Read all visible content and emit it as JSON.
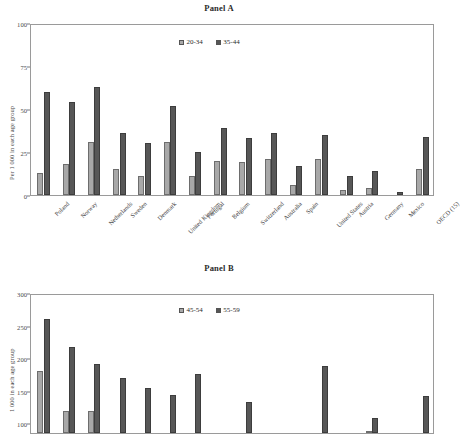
{
  "figure": {
    "ylabel_a": "Per 1 000 in each age group",
    "ylabel_b": "1 000 in each age group"
  },
  "panel_a": {
    "title": "Panel A",
    "legend": [
      {
        "label": "20-34",
        "swatch": "light-gray-square-icon"
      },
      {
        "label": "35-44",
        "swatch": "dark-gray-square-icon"
      }
    ],
    "yticks": [
      "100",
      "75",
      "50",
      "25",
      "0"
    ]
  },
  "panel_b": {
    "title": "Panel B",
    "legend": [
      {
        "label": "45-54",
        "swatch": "light-gray-square-icon"
      },
      {
        "label": "55-59",
        "swatch": "dark-gray-square-icon"
      }
    ],
    "yticks": [
      "300",
      "250",
      "200",
      "150",
      "100"
    ]
  },
  "chart_data": [
    {
      "type": "bar",
      "title": "Panel A",
      "xlabel": "",
      "ylabel": "Per 1 000 in each age group",
      "ylim": [
        0,
        100
      ],
      "yticks": [
        0,
        25,
        50,
        75,
        100
      ],
      "grid": false,
      "legend_position": "top-center",
      "categories": [
        "Poland",
        "Norway",
        "Netherlands",
        "Sweden",
        "Denmark",
        "United Kingdom",
        "Portugal",
        "Belgium",
        "Switzerland",
        "Australia",
        "Spain",
        "United States",
        "Austria",
        "Germany",
        "Mexico",
        "OECD (15)"
      ],
      "series": [
        {
          "name": "20-34",
          "color": "#a8a8a8",
          "values": [
            13,
            18,
            31,
            15,
            11,
            31,
            11,
            20,
            19,
            21,
            6,
            21,
            3,
            4,
            0,
            15
          ]
        },
        {
          "name": "35-44",
          "color": "#575757",
          "values": [
            60,
            54,
            63,
            36,
            30,
            52,
            25,
            39,
            33,
            36,
            17,
            35,
            11,
            14,
            2,
            34
          ]
        }
      ]
    },
    {
      "type": "bar",
      "title": "Panel B",
      "xlabel": "",
      "ylabel": "1 000 in each age group",
      "ylim": [
        0,
        300
      ],
      "yticks": [
        100,
        150,
        200,
        250,
        300
      ],
      "grid": false,
      "legend_position": "top-center",
      "note": "Panel B is cropped at the bottom of the screenshot; x-axis labels are not visible.",
      "categories": [
        "Poland",
        "Norway",
        "Netherlands",
        "Sweden",
        "Denmark",
        "United Kingdom",
        "Portugal",
        "Belgium",
        "Switzerland",
        "Australia",
        "Spain",
        "United States",
        "Austria",
        "Germany",
        "Mexico",
        "OECD (15)"
      ],
      "series": [
        {
          "name": "45-54",
          "color": "#a8a8a8",
          "values": [
            180,
            119,
            119,
            0,
            0,
            0,
            0,
            78,
            0,
            0,
            0,
            0,
            0,
            86,
            0,
            0
          ]
        },
        {
          "name": "55-59",
          "color": "#575757",
          "values": [
            260,
            217,
            191,
            169,
            154,
            143,
            175,
            0,
            132,
            0,
            0,
            188,
            0,
            108,
            0,
            142
          ]
        }
      ]
    }
  ]
}
